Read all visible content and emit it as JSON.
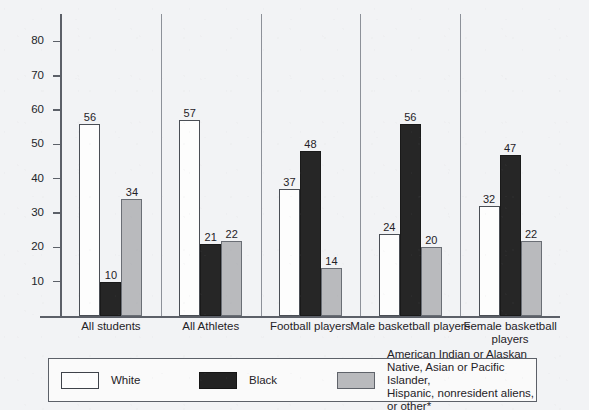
{
  "chart_data": {
    "type": "bar",
    "title": "",
    "xlabel": "",
    "ylabel": "",
    "ylim": [
      0,
      88
    ],
    "grid": false,
    "legend_position": "bottom",
    "y_ticks": [
      10,
      20,
      30,
      40,
      50,
      60,
      70,
      80
    ],
    "categories": [
      "All students",
      "All Athletes",
      "Football players",
      "Male basketball players",
      "Female basketball players"
    ],
    "series": [
      {
        "name": "White",
        "color": "#fdfdfd",
        "values": [
          56,
          57,
          37,
          24,
          32
        ]
      },
      {
        "name": "Black",
        "color": "#262626",
        "values": [
          10,
          21,
          48,
          56,
          47
        ]
      },
      {
        "name": "American Indian or Alaskan Native, Asian or Pacific Islander, Hispanic, nonresident aliens, or other*",
        "color": "#b9babd",
        "values": [
          34,
          22,
          14,
          20,
          22
        ]
      }
    ]
  },
  "legend": {
    "items": [
      {
        "swatch": "white",
        "label": "White"
      },
      {
        "swatch": "black",
        "label": "Black"
      },
      {
        "swatch": "gray",
        "label": "American Indian or Alaskan Native, Asian or Pacific Islander,\nHispanic, nonresident aliens, or other*"
      }
    ]
  }
}
